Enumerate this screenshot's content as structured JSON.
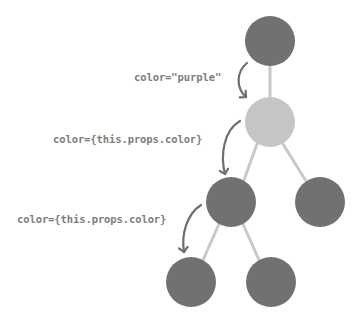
{
  "diagram": {
    "type": "component-tree-prop-flow",
    "colors": {
      "dark_node": "#717171",
      "light_node": "#c5c5c5",
      "edge": "#c9c9c9",
      "arrow": "#6e6e6e",
      "label_text": "#7e7e7e",
      "background": "#ffffff"
    },
    "nodes": [
      {
        "id": "root",
        "shade": "dark",
        "cx": 270,
        "cy": 41,
        "r": 25
      },
      {
        "id": "child",
        "shade": "light",
        "cx": 270,
        "cy": 122,
        "r": 25
      },
      {
        "id": "grandchild-left",
        "shade": "dark",
        "cx": 231,
        "cy": 202,
        "r": 25
      },
      {
        "id": "grandchild-right",
        "shade": "dark",
        "cx": 320,
        "cy": 202,
        "r": 25
      },
      {
        "id": "great-grandchild-left",
        "shade": "dark",
        "cx": 191,
        "cy": 282,
        "r": 25
      },
      {
        "id": "great-grandchild-right",
        "shade": "dark",
        "cx": 271,
        "cy": 282,
        "r": 25
      }
    ],
    "edges": [
      {
        "from": "root",
        "to": "child"
      },
      {
        "from": "child",
        "to": "grandchild-left"
      },
      {
        "from": "child",
        "to": "grandchild-right"
      },
      {
        "from": "grandchild-left",
        "to": "great-grandchild-left"
      },
      {
        "from": "grandchild-left",
        "to": "great-grandchild-right"
      }
    ],
    "labels": [
      {
        "id": "label-1",
        "text": "color=\"purple\"",
        "from": "root",
        "to": "child"
      },
      {
        "id": "label-2",
        "text": "color={this.props.color}",
        "from": "child",
        "to": "grandchild-left"
      },
      {
        "id": "label-3",
        "text": "color={this.props.color}",
        "from": "grandchild-left",
        "to": "great-grandchild-left"
      }
    ]
  }
}
